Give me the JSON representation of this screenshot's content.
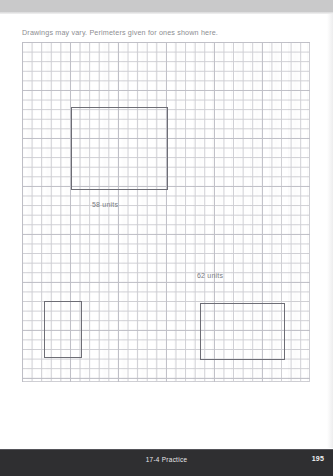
{
  "page": {
    "width": 333,
    "height": 476,
    "background_color": "#ffffff",
    "scan_band_color": "#c9c9ca"
  },
  "worksheet": {
    "instruction": "Drawings may vary. Perimeters given for ones shown here."
  },
  "grid": {
    "x": 22,
    "y": 42,
    "width": 288,
    "height": 340,
    "cell_size": 9.6,
    "columns": 30,
    "rows": 35,
    "line_color": "#cfcfd4",
    "major_line_color": "#bcbcc4"
  },
  "shapes": [
    {
      "name": "rectangle-top",
      "x": 71,
      "y": 107,
      "width": 97,
      "height": 83,
      "stroke_color": "#6d6d75"
    },
    {
      "name": "rectangle-bottom-left",
      "x": 44,
      "y": 301,
      "width": 38,
      "height": 57,
      "stroke_color": "#6d6d75"
    },
    {
      "name": "rectangle-bottom-right",
      "x": 200,
      "y": 303,
      "width": 85,
      "height": 57,
      "stroke_color": "#6d6d75"
    }
  ],
  "labels": [
    {
      "name": "perimeter-label-58",
      "text": "58 units",
      "x": 92,
      "y": 201,
      "color": "#7b7b82"
    },
    {
      "name": "perimeter-label-62",
      "text": "62 units",
      "x": 197,
      "y": 272,
      "color": "#7b7b82"
    }
  ],
  "footer": {
    "title": "17-4 Practice",
    "page_number": "195",
    "background_color": "#2f2f31",
    "text_color": "#e9e9ec"
  }
}
